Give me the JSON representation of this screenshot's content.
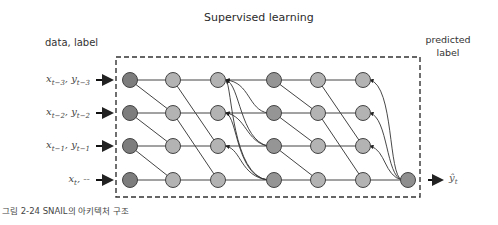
{
  "title": "Supervised learning",
  "data_label": "data, label",
  "predicted_label": {
    "line1": "predicted",
    "line2": "label"
  },
  "inputs": [
    {
      "x": "x",
      "x_sub": "t−3",
      "sep": ", ",
      "y": "y",
      "y_sub": "t−3"
    },
    {
      "x": "x",
      "x_sub": "t−2",
      "sep": ", ",
      "y": "y",
      "y_sub": "t−2"
    },
    {
      "x": "x",
      "x_sub": "t−1",
      "sep": ", ",
      "y": "y",
      "y_sub": "t−1"
    },
    {
      "x": "x",
      "x_sub": "t",
      "sep": ", ",
      "y": "--",
      "y_sub": ""
    }
  ],
  "output": {
    "symbol": "ŷ",
    "sub": "t"
  },
  "caption": "그림 2-24 SNAIL의 아키텍처 구조",
  "colors": {
    "input_node": "#7a7a7a",
    "hidden_node": "#b0b0b0",
    "attention_node": "#8f8f8f",
    "edge": "#3a3a3a",
    "box_border": "#333333"
  },
  "graph": {
    "columns": 7,
    "rows": 4,
    "column_types": [
      "input",
      "tc",
      "tc",
      "attention",
      "tc",
      "tc",
      "attention"
    ],
    "output_node": "final"
  }
}
